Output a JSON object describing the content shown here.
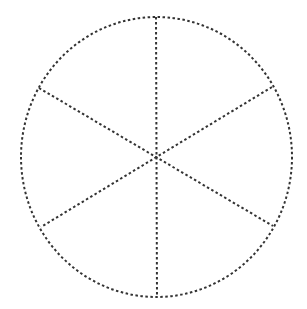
{
  "diagram": {
    "type": "dotted circle divided into 6 equal sections",
    "sections": 6,
    "stroke_color": "#333333",
    "background": "#ffffff",
    "ellipse": {
      "cx": 156.5,
      "cy": 157,
      "rx": 135.5,
      "ry": 140
    },
    "divider_lines": [
      {
        "x1": 156,
        "y1": 17,
        "x2": 157,
        "y2": 297
      },
      {
        "x1": 39,
        "y1": 88,
        "x2": 273,
        "y2": 226
      },
      {
        "x1": 272,
        "y1": 87,
        "x2": 41,
        "y2": 227
      }
    ]
  }
}
